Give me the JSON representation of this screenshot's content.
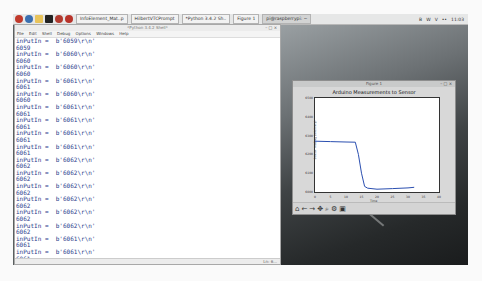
{
  "taskbar": {
    "launcher_icons": [
      "raspberry-menu-icon",
      "browser-icon",
      "file-manager-icon",
      "terminal-icon",
      "mathematica-icon",
      "wolfram-icon"
    ],
    "tasks": [
      {
        "label": "InfoElement_Mat..p",
        "active": false
      },
      {
        "label": "HilbertVTCPrompt",
        "active": false
      },
      {
        "label": "*Python 3.4.2 Sh..",
        "active": false
      },
      {
        "label": "Figure 1",
        "active": false
      },
      {
        "label": "pi@raspberrypi: ~",
        "active": true
      }
    ],
    "tray": {
      "bluetooth": "B",
      "wifi": "W",
      "volume": "V",
      "cpu": "••",
      "clock": "11:03"
    }
  },
  "idle": {
    "title": "*Python 3.4.2 Shell*",
    "menu": [
      "File",
      "Edit",
      "Shell",
      "Debug",
      "Options",
      "Windows",
      "Help"
    ],
    "lines": [
      "inPutIn =  b'6059\\r\\n'",
      "6059",
      "inPutIn =  b'6060\\r\\n'",
      "6060",
      "inPutIn =  b'6060\\r\\n'",
      "6060",
      "inPutIn =  b'6061\\r\\n'",
      "6061",
      "inPutIn =  b'6060\\r\\n'",
      "6060",
      "inPutIn =  b'6061\\r\\n'",
      "6061",
      "inPutIn =  b'6061\\r\\n'",
      "6061",
      "inPutIn =  b'6061\\r\\n'",
      "6061",
      "inPutIn =  b'6061\\r\\n'",
      "6061",
      "inPutIn =  b'6062\\r\\n'",
      "6062",
      "inPutIn =  b'6062\\r\\n'",
      "6062",
      "inPutIn =  b'6062\\r\\n'",
      "6062",
      "inPutIn =  b'6062\\r\\n'",
      "6062",
      "inPutIn =  b'6062\\r\\n'",
      "6062",
      "inPutIn =  b'6062\\r\\n'",
      "6062",
      "inPutIn =  b'6061\\r\\n'",
      "6061",
      "inPutIn =  b'6061\\r\\n'",
      "6061"
    ],
    "status": "Ln: 6..."
  },
  "figure": {
    "window_title": "Figure 1",
    "plot_title": "Arduino Measurements to Sensor",
    "ylabel": "Sensor reading (arbitrary)",
    "xlabel": "Time",
    "yticks": [
      "6500",
      "6400",
      "6300",
      "6200",
      "6100",
      "6000"
    ],
    "xticks": [
      "0",
      "5",
      "10",
      "15",
      "20",
      "25",
      "30",
      "35",
      "40"
    ],
    "toolbar": [
      "home-icon",
      "back-icon",
      "forward-icon",
      "pan-icon",
      "zoom-icon",
      "configure-icon",
      "save-icon"
    ]
  },
  "chart_data": {
    "type": "line",
    "title": "Arduino Measurements to Sensor",
    "xlabel": "Time",
    "ylabel": "Sensor reading",
    "xlim": [
      0,
      40
    ],
    "ylim": [
      6000,
      6500
    ],
    "x": [
      0,
      5,
      10,
      13,
      14,
      15,
      16,
      17,
      20,
      25,
      30,
      32
    ],
    "values": [
      6270,
      6268,
      6266,
      6265,
      6200,
      6100,
      6030,
      6020,
      6015,
      6018,
      6022,
      6025
    ],
    "series_color": "#2b4fb0"
  }
}
